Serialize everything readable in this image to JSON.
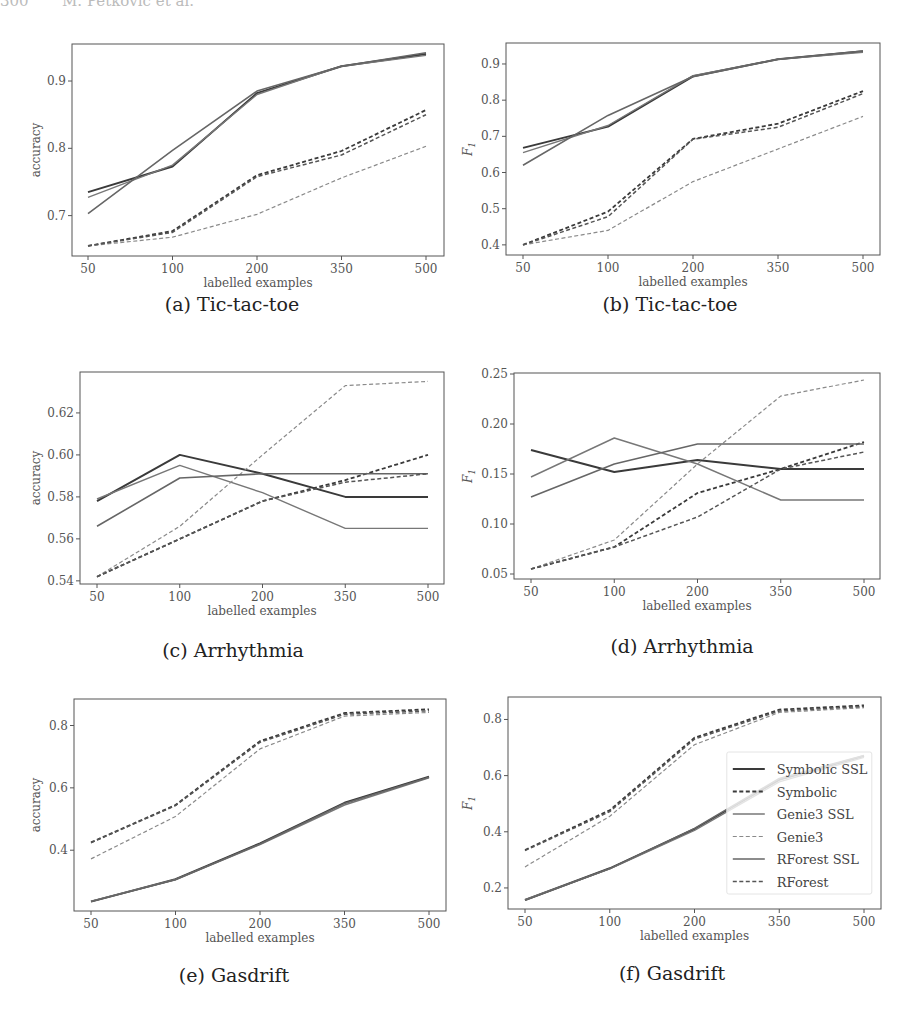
{
  "page": {
    "header": "300       M. Petkovic et al."
  },
  "legend": {
    "entries": [
      {
        "label": "Symbolic SSL",
        "style": "solid",
        "color": "#3a3a3a",
        "width": 2.0
      },
      {
        "label": "Symbolic",
        "style": "dashed",
        "color": "#3a3a3a",
        "width": 1.8
      },
      {
        "label": "Genie3 SSL",
        "style": "solid",
        "color": "#777777",
        "width": 1.4
      },
      {
        "label": "Genie3",
        "style": "dashed",
        "color": "#8a8a8a",
        "width": 1.2
      },
      {
        "label": "RForest SSL",
        "style": "solid",
        "color": "#666666",
        "width": 1.6
      },
      {
        "label": "RForest",
        "style": "dashed",
        "color": "#555555",
        "width": 1.5
      }
    ]
  },
  "chart_data": [
    {
      "id": "a",
      "type": "line",
      "caption": "(a) Tic-tac-toe",
      "title": "Tic-tac-toe",
      "xlabel": "labelled examples",
      "ylabel": "accuracy",
      "categories": [
        "50",
        "100",
        "200",
        "350",
        "500"
      ],
      "ylim": [
        0.64,
        0.955
      ],
      "yticks": [
        0.7,
        0.8,
        0.9
      ],
      "ytick_labels": [
        "0.7",
        "0.8",
        "0.9"
      ],
      "grid": false,
      "legend": false,
      "series": [
        {
          "name": "Symbolic SSL",
          "values": [
            0.735,
            0.773,
            0.882,
            0.922,
            0.94
          ]
        },
        {
          "name": "Symbolic",
          "values": [
            0.655,
            0.677,
            0.76,
            0.796,
            0.857
          ]
        },
        {
          "name": "Genie3 SSL",
          "values": [
            0.727,
            0.775,
            0.88,
            0.922,
            0.938
          ]
        },
        {
          "name": "Genie3",
          "values": [
            0.655,
            0.668,
            0.702,
            0.756,
            0.803
          ]
        },
        {
          "name": "RForest SSL",
          "values": [
            0.703,
            0.797,
            0.885,
            0.922,
            0.942
          ]
        },
        {
          "name": "RForest",
          "values": [
            0.655,
            0.675,
            0.758,
            0.79,
            0.85
          ]
        }
      ]
    },
    {
      "id": "b",
      "type": "line",
      "caption": "(b) Tic-tac-toe",
      "title": "Tic-tac-toe",
      "xlabel": "labelled examples",
      "ylabel": "F1",
      "categories": [
        "50",
        "100",
        "200",
        "350",
        "500"
      ],
      "ylim": [
        0.372,
        0.958
      ],
      "yticks": [
        0.4,
        0.5,
        0.6,
        0.7,
        0.8,
        0.9
      ],
      "ytick_labels": [
        "0.4",
        "0.5",
        "0.6",
        "0.7",
        "0.8",
        "0.9"
      ],
      "grid": false,
      "legend": false,
      "series": [
        {
          "name": "Symbolic SSL",
          "values": [
            0.668,
            0.727,
            0.866,
            0.913,
            0.935
          ]
        },
        {
          "name": "Symbolic",
          "values": [
            0.4,
            0.492,
            0.693,
            0.735,
            0.825
          ]
        },
        {
          "name": "Genie3 SSL",
          "values": [
            0.655,
            0.73,
            0.868,
            0.913,
            0.932
          ]
        },
        {
          "name": "Genie3",
          "values": [
            0.4,
            0.44,
            0.575,
            0.665,
            0.755
          ]
        },
        {
          "name": "RForest SSL",
          "values": [
            0.62,
            0.758,
            0.865,
            0.913,
            0.936
          ]
        },
        {
          "name": "RForest",
          "values": [
            0.4,
            0.478,
            0.692,
            0.725,
            0.818
          ]
        }
      ]
    },
    {
      "id": "c",
      "type": "line",
      "caption": "(c) Arrhythmia",
      "title": "Arrhythmia",
      "xlabel": "labelled examples",
      "ylabel": "accuracy",
      "categories": [
        "50",
        "100",
        "200",
        "350",
        "500"
      ],
      "ylim": [
        0.5385,
        0.6395
      ],
      "yticks": [
        0.54,
        0.56,
        0.58,
        0.6,
        0.62
      ],
      "ytick_labels": [
        "0.54",
        "0.56",
        "0.58",
        "0.60",
        "0.62"
      ],
      "grid": false,
      "legend": false,
      "series": [
        {
          "name": "Symbolic SSL",
          "values": [
            0.578,
            0.6,
            0.591,
            0.58,
            0.58
          ]
        },
        {
          "name": "Symbolic",
          "values": [
            0.542,
            0.56,
            0.578,
            0.588,
            0.6
          ]
        },
        {
          "name": "Genie3 SSL",
          "values": [
            0.579,
            0.595,
            0.582,
            0.565,
            0.565
          ]
        },
        {
          "name": "Genie3",
          "values": [
            0.542,
            0.566,
            0.6,
            0.633,
            0.635
          ]
        },
        {
          "name": "RForest SSL",
          "values": [
            0.566,
            0.589,
            0.591,
            0.591,
            0.591
          ]
        },
        {
          "name": "RForest",
          "values": [
            0.542,
            0.56,
            0.578,
            0.587,
            0.591
          ]
        }
      ]
    },
    {
      "id": "d",
      "type": "line",
      "caption": "(d) Arrhythmia",
      "title": "Arrhythmia",
      "xlabel": "labelled examples",
      "ylabel": "F1",
      "categories": [
        "50",
        "100",
        "200",
        "350",
        "500"
      ],
      "ylim": [
        0.045,
        0.251
      ],
      "yticks": [
        0.05,
        0.1,
        0.15,
        0.2,
        0.25
      ],
      "ytick_labels": [
        "0.05",
        "0.10",
        "0.15",
        "0.20",
        "0.25"
      ],
      "grid": false,
      "legend": false,
      "series": [
        {
          "name": "Symbolic SSL",
          "values": [
            0.174,
            0.152,
            0.164,
            0.155,
            0.155
          ]
        },
        {
          "name": "Symbolic",
          "values": [
            0.055,
            0.077,
            0.131,
            0.155,
            0.182
          ]
        },
        {
          "name": "Genie3 SSL",
          "values": [
            0.147,
            0.186,
            0.16,
            0.124,
            0.124
          ]
        },
        {
          "name": "Genie3",
          "values": [
            0.055,
            0.084,
            0.16,
            0.228,
            0.244
          ]
        },
        {
          "name": "RForest SSL",
          "values": [
            0.127,
            0.16,
            0.18,
            0.18,
            0.18
          ]
        },
        {
          "name": "RForest",
          "values": [
            0.055,
            0.077,
            0.107,
            0.155,
            0.172
          ]
        }
      ]
    },
    {
      "id": "e",
      "type": "line",
      "caption": "(e) Gasdrift",
      "title": "Gasdrift",
      "xlabel": "labelled examples",
      "ylabel": "accuracy",
      "categories": [
        "50",
        "100",
        "200",
        "350",
        "500"
      ],
      "ylim": [
        0.205,
        0.885
      ],
      "yticks": [
        0.4,
        0.6,
        0.8
      ],
      "ytick_labels": [
        "0.4",
        "0.6",
        "0.8"
      ],
      "grid": false,
      "legend": false,
      "series": [
        {
          "name": "Symbolic SSL",
          "values": [
            0.235,
            0.307,
            0.422,
            0.552,
            0.636
          ]
        },
        {
          "name": "Symbolic",
          "values": [
            0.425,
            0.545,
            0.75,
            0.84,
            0.852
          ]
        },
        {
          "name": "Genie3 SSL",
          "values": [
            0.236,
            0.306,
            0.418,
            0.545,
            0.632
          ]
        },
        {
          "name": "Genie3",
          "values": [
            0.372,
            0.508,
            0.725,
            0.83,
            0.842
          ]
        },
        {
          "name": "RForest SSL",
          "values": [
            0.235,
            0.305,
            0.42,
            0.55,
            0.634
          ]
        },
        {
          "name": "RForest",
          "values": [
            0.424,
            0.543,
            0.746,
            0.836,
            0.847
          ]
        }
      ]
    },
    {
      "id": "f",
      "type": "line",
      "caption": "(f) Gasdrift",
      "title": "Gasdrift",
      "xlabel": "labelled examples",
      "ylabel": "F1",
      "categories": [
        "50",
        "100",
        "200",
        "350",
        "500"
      ],
      "ylim": [
        0.125,
        0.88
      ],
      "yticks": [
        0.2,
        0.4,
        0.6,
        0.8
      ],
      "ytick_labels": [
        "0.2",
        "0.4",
        "0.6",
        "0.8"
      ],
      "grid": false,
      "legend": true,
      "legend_position": "center right",
      "series": [
        {
          "name": "Symbolic SSL",
          "values": [
            0.157,
            0.27,
            0.41,
            0.585,
            0.67
          ]
        },
        {
          "name": "Symbolic",
          "values": [
            0.335,
            0.477,
            0.735,
            0.835,
            0.85
          ]
        },
        {
          "name": "Genie3 SSL",
          "values": [
            0.158,
            0.268,
            0.405,
            0.578,
            0.665
          ]
        },
        {
          "name": "Genie3",
          "values": [
            0.275,
            0.455,
            0.71,
            0.825,
            0.842
          ]
        },
        {
          "name": "RForest SSL",
          "values": [
            0.156,
            0.269,
            0.412,
            0.59,
            0.672
          ]
        },
        {
          "name": "RForest",
          "values": [
            0.333,
            0.472,
            0.73,
            0.83,
            0.846
          ]
        }
      ]
    }
  ],
  "layout": [
    {
      "left": 72,
      "top": 44,
      "right": 444,
      "bottom": 256,
      "xfirst": 88,
      "xlast": 426,
      "caption_x": 232,
      "caption_y": 305,
      "ylabel_x": 40
    },
    {
      "left": 506,
      "top": 43,
      "right": 880,
      "bottom": 255,
      "xfirst": 523,
      "xlast": 863,
      "caption_x": 670,
      "caption_y": 305,
      "ylabel_x": 472
    },
    {
      "left": 80,
      "top": 372,
      "right": 444,
      "bottom": 584,
      "xfirst": 97,
      "xlast": 428,
      "caption_x": 233,
      "caption_y": 651,
      "ylabel_x": 40
    },
    {
      "left": 514,
      "top": 373,
      "right": 880,
      "bottom": 579,
      "xfirst": 531,
      "xlast": 864,
      "caption_x": 682,
      "caption_y": 647,
      "ylabel_x": 472
    },
    {
      "left": 74,
      "top": 699,
      "right": 446,
      "bottom": 911,
      "xfirst": 91,
      "xlast": 429,
      "caption_x": 234,
      "caption_y": 976,
      "ylabel_x": 40
    },
    {
      "left": 508,
      "top": 697,
      "right": 881,
      "bottom": 909,
      "xfirst": 525,
      "xlast": 864,
      "caption_x": 672,
      "caption_y": 974,
      "ylabel_x": 472
    }
  ]
}
